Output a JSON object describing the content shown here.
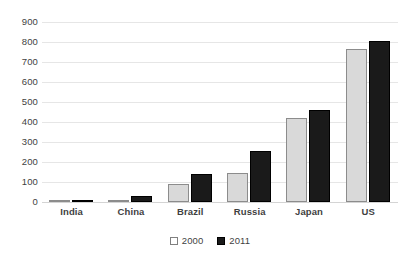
{
  "chart_data": {
    "type": "bar",
    "title": "",
    "subtitle": "",
    "xlabel": "",
    "ylabel": "",
    "categories": [
      "India",
      "China",
      "Brazil",
      "Russia",
      "Japan",
      "US"
    ],
    "series": [
      {
        "name": "2000",
        "color": "#d9d9d9",
        "values": [
          5,
          4,
          90,
          143,
          418,
          765
        ]
      },
      {
        "name": "2011",
        "color": "#1a1a1a",
        "values": [
          9,
          30,
          140,
          253,
          460,
          805
        ]
      }
    ],
    "ylim": [
      0,
      900
    ],
    "ytick_step": 100,
    "yticks": [
      "0",
      "100",
      "200",
      "300",
      "400",
      "500",
      "600",
      "700",
      "800",
      "900"
    ],
    "grid": true,
    "grid_axis": "y",
    "legend": [
      "2000",
      "2011"
    ],
    "legend_position": "bottom"
  }
}
